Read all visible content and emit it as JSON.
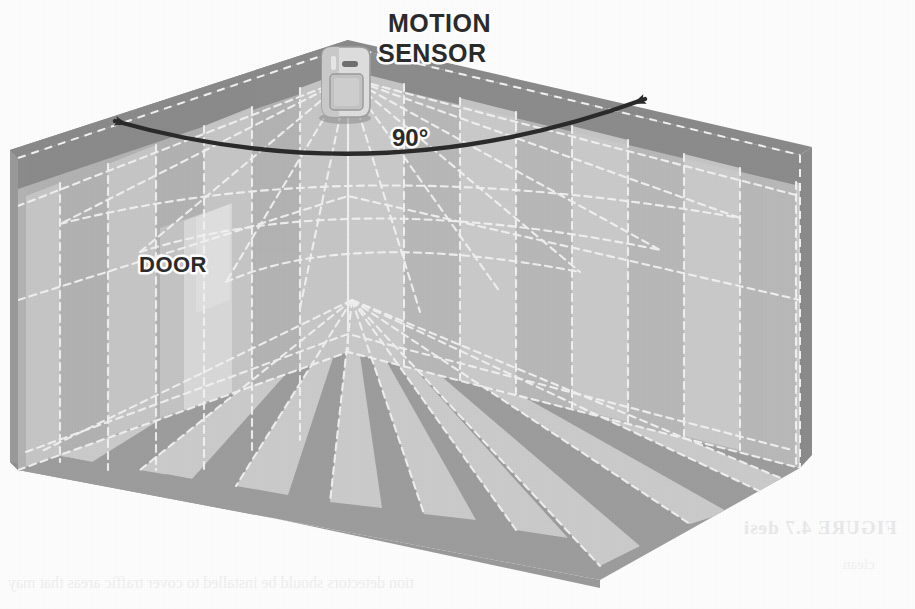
{
  "figure": {
    "kind": "isometric-room-cutaway",
    "labels": {
      "sensor_line1": "MOTION",
      "sensor_line2": "SENSOR",
      "door": "DOOR",
      "angle": "90°"
    },
    "ghost_showthrough": {
      "caption": "FIGURE 4.7  desi",
      "body_line_1": "tion detectors should be installed to cover traffic areas that may",
      "body_line_2": "clean"
    }
  },
  "geometry": {
    "canvas": {
      "width": 915,
      "height": 609
    },
    "room": {
      "apex_back": [
        348,
        47
      ],
      "ceiling_left": [
        18,
        158
      ],
      "ceiling_right": [
        800,
        155
      ],
      "ceiling_front": [
        600,
        272
      ],
      "floor_left": [
        18,
        470
      ],
      "floor_right": [
        800,
        468
      ],
      "floor_front": [
        600,
        580
      ],
      "floor_back": [
        348,
        352
      ]
    },
    "sensor": {
      "x": 322,
      "y": 52,
      "width": 46,
      "height": 64
    },
    "beam_origin": [
      352,
      300
    ],
    "beam_count": 17,
    "sweep_degrees": 90
  },
  "colors": {
    "paper": "#fdfdfd",
    "outer_wall": "#9a9a9a",
    "ceiling_band": "#8f8f8f",
    "inner_wall_light": "#c3c3c3",
    "inner_wall_mid": "#b6b6b6",
    "floor_base": "#9d9d9d",
    "beam_wedge": "#cfcfcf",
    "door_panel": "#d8d8d8",
    "door_frame": "#c9c9c9",
    "sensor_body": "#dcdcdc",
    "sensor_lens": "#c6c6c6",
    "dash_line": "#f4f4f4",
    "arc_line": "#2b2b2b",
    "label_text": "#2b2b2b",
    "label_halo": "#ffffff"
  },
  "annotations": {
    "arc": {
      "label": "90°",
      "left_arrow_tip": [
        108,
        118
      ],
      "right_arrow_tip": [
        651,
        96
      ],
      "description": "Double-headed arc arrow spanning the sensor's horizontal field of view"
    }
  }
}
